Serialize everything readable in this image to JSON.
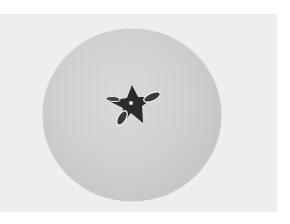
{
  "image": {
    "description": "Grayscale photograph of a horizontally sliced apple showing the star-shaped seed core",
    "subject": "apple cross-section",
    "colors": {
      "border": "#ffffff",
      "background": "#eeeeee",
      "flesh": "#d0d0d0",
      "rim": "#7a7a7a",
      "core": "#2a2a2a",
      "seed_outline": "#f2f2f2"
    }
  }
}
